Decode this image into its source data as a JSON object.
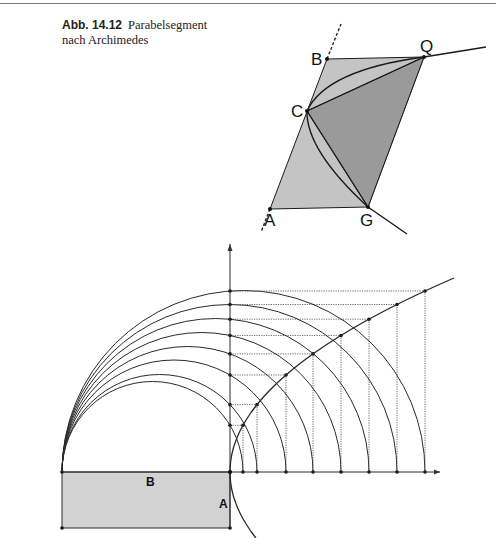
{
  "header": {
    "figure_label": "Abb. 14.12",
    "caption_line1": "Parabelsegment",
    "caption_line2": "nach Archimedes"
  },
  "top_figure": {
    "points": {
      "B": {
        "label": "B",
        "x": 327,
        "y": 59
      },
      "Q": {
        "label": "Q",
        "x": 424,
        "y": 57
      },
      "C": {
        "label": "C",
        "x": 307,
        "y": 111
      },
      "A": {
        "label": "A",
        "x": 270,
        "y": 209
      },
      "G": {
        "label": "G",
        "x": 368,
        "y": 207
      }
    },
    "colors": {
      "light_fill": "#c4c4c4",
      "dark_fill": "#9a9a9a",
      "stroke": "#1a1a1a"
    }
  },
  "bottom_figure": {
    "origin": {
      "x": 230,
      "y": 472
    },
    "left_end_x": 62,
    "x_points": [
      243,
      257,
      286,
      313,
      341,
      369,
      397,
      425
    ],
    "axis_x_end": 440,
    "axis_y_end": 244,
    "rect": {
      "x": 62,
      "y": 472,
      "w": 168,
      "h": 56,
      "fill": "#d2d2d2"
    },
    "labels": {
      "B": {
        "label": "B",
        "x": 146,
        "y": 486
      },
      "A": {
        "label": "A",
        "x": 219,
        "y": 508
      }
    }
  }
}
